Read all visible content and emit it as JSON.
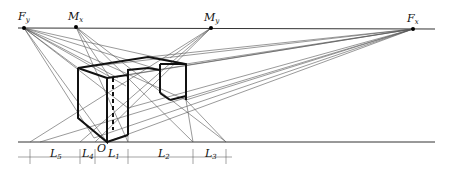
{
  "diagram": {
    "type": "two-point perspective construction (measuring point method)",
    "points": {
      "Fy": {
        "label": "F",
        "sub": "y",
        "x": 24,
        "y": 28
      },
      "Mx": {
        "label": "M",
        "sub": "x",
        "x": 76,
        "y": 27
      },
      "My": {
        "label": "M",
        "sub": "y",
        "x": 211,
        "y": 28
      },
      "Fx": {
        "label": "F",
        "sub": "x",
        "x": 413,
        "y": 29
      }
    },
    "origin_label": "O",
    "horizon_line": {
      "label": "horizon line",
      "y": 28
    },
    "ground_line": {
      "label": "ground line",
      "y": 142
    },
    "dimensions": [
      {
        "label": "L",
        "sub": "5"
      },
      {
        "label": "L",
        "sub": "4"
      },
      {
        "label": "L",
        "sub": "1"
      },
      {
        "label": "L",
        "sub": "2"
      },
      {
        "label": "L",
        "sub": "3"
      }
    ]
  }
}
